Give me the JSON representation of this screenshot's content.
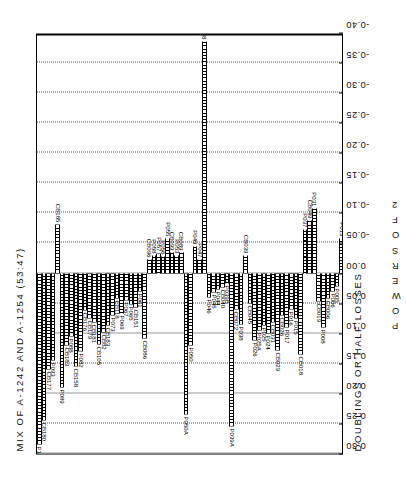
{
  "chart_data": {
    "type": "bar",
    "title": "MIX OF A-1242 AND A-1254 (53:47)",
    "right_label": "DOUBLINGS OR HALF LOSSES",
    "xlabel": "POWERS OF 2",
    "ylabel": "",
    "orientation": "horizontal",
    "grid": "vertical dotted gridlines at every tick",
    "legend": "none",
    "xlim": [
      0.3,
      -0.4
    ],
    "x_direction": "decreasing left to right",
    "xticks": [
      "0.30",
      "0.25",
      "0.20",
      "0.15",
      "0.10",
      "0.05",
      "0.00",
      "-0.05",
      "-0.10",
      "-0.15",
      "-0.20",
      "-0.25",
      "-0.30",
      "-0.35",
      "-0.40"
    ],
    "xtick_values": [
      0.3,
      0.25,
      0.2,
      0.15,
      0.1,
      0.05,
      0.0,
      -0.05,
      -0.1,
      -0.15,
      -0.2,
      -0.25,
      -0.3,
      -0.35,
      -0.4
    ],
    "categories": [
      "P106",
      "CB180",
      "CB177",
      "P093",
      "CB185",
      "P089",
      "CB183",
      "P088",
      "CB158",
      "P082",
      "CB176",
      "CB179",
      "CB181",
      "CB105",
      "CB82",
      "CB183b",
      "P073",
      "CB118",
      "P069",
      "P067",
      "P065",
      "CB151",
      "P061",
      "CB086",
      "CB096",
      "P058",
      "P057",
      "P056",
      "P055",
      "CB099",
      "P053",
      "CB089",
      "P050A",
      "P050",
      "P049",
      "P047",
      "P048",
      "P046",
      "P045",
      "P044",
      "CB040",
      "P039B",
      "P039A",
      "CB072",
      "P038",
      "CB039",
      "CB045",
      "P026",
      "P025A",
      "P025",
      "P024",
      "CB031",
      "CB029",
      "CB026",
      "P017",
      "P016",
      "P015",
      "CB018",
      "P037",
      "CB049",
      "P031",
      "CB019",
      "P008",
      "CB006",
      "P006",
      "P005",
      "P013"
    ],
    "values": [
      0.285,
      0.245,
      0.16,
      0.145,
      -0.08,
      0.19,
      0.12,
      0.105,
      0.155,
      0.13,
      0.062,
      0.075,
      0.082,
      0.118,
      0.098,
      0.088,
      0.07,
      0.042,
      0.068,
      0.045,
      0.052,
      0.058,
      0.03,
      0.108,
      -0.022,
      -0.03,
      -0.033,
      -0.028,
      -0.057,
      -0.034,
      -0.03,
      -0.035,
      0.235,
      0.12,
      -0.045,
      -0.022,
      -0.385,
      0.04,
      0.033,
      0.027,
      0.024,
      0.018,
      0.255,
      0.06,
      0.085,
      -0.03,
      0.05,
      0.112,
      0.095,
      0.088,
      0.1,
      0.082,
      0.128,
      0.07,
      0.09,
      0.06,
      0.075,
      0.135,
      -0.072,
      -0.088,
      -0.108,
      0.048,
      0.09,
      0.042,
      0.03,
      0.022,
      -0.058
    ]
  },
  "axis": {
    "xlabel_chars": [
      "P",
      "O",
      "W",
      "E",
      "R",
      "S",
      "O",
      "F",
      "2"
    ]
  }
}
